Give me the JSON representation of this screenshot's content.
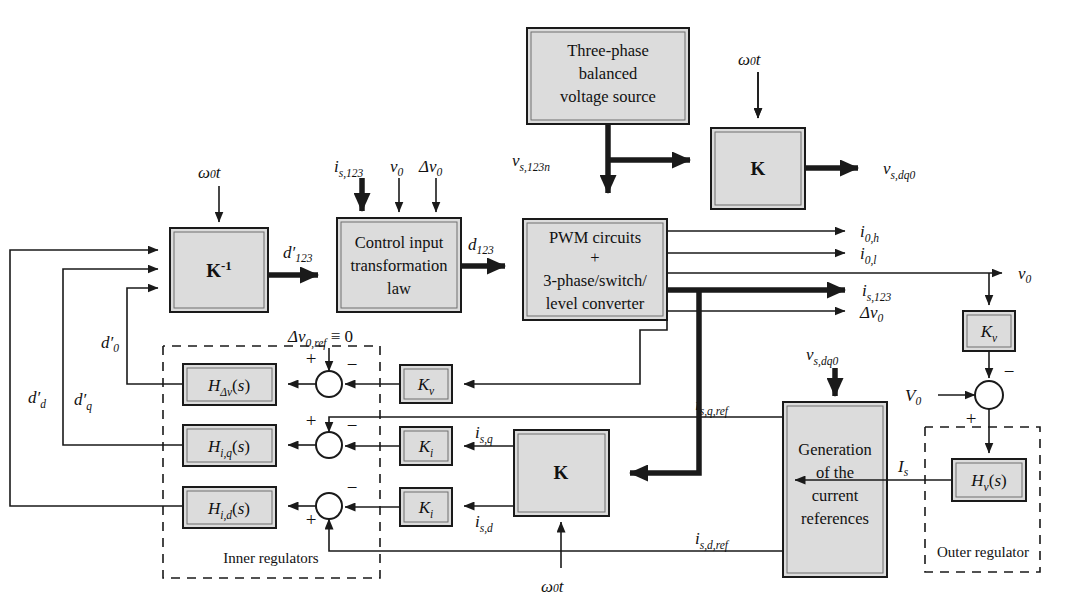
{
  "diagram": {
    "blocks": {
      "source": "Three-phase balanced voltage source",
      "source_l1": "Three-phase",
      "source_l2": "balanced",
      "source_l3": "voltage source",
      "k_top": "K",
      "k_inv": "K−1",
      "control_l1": "Control input",
      "control_l2": "transformation",
      "control_l3": "law",
      "pwm_l1": "PWM circuits",
      "pwm_l2": "+",
      "pwm_l3": "3-phase/switch/",
      "pwm_l4": "level converter",
      "k_mid": "K",
      "gen_l1": "Generation",
      "gen_l2": "of the",
      "gen_l3": "current",
      "gen_l4": "references",
      "h_dv": "H",
      "h_iq": "H",
      "h_id": "H",
      "h_v": "H",
      "kv_left": "K",
      "kv_right": "K",
      "ki_q": "K",
      "ki_d": "K"
    },
    "transfer_labels": {
      "h_dv_sub": "Δv",
      "h_dv_arg": "(s)",
      "h_iq_sub": "i,q",
      "h_iq_arg": "(s)",
      "h_id_sub": "i,d",
      "h_id_arg": "(s)",
      "h_v_sub": "v",
      "h_v_arg": "(s)",
      "kv_sub": "v",
      "ki_sub": "i"
    },
    "signals": {
      "omega_t": "ω0t",
      "omega_base": "ω",
      "omega_sub": "0",
      "omega_var": "t",
      "vs123n": "vs,123n",
      "vsdq0": "vs,dq0",
      "is123": "is,123",
      "v0": "v0",
      "dv0": "Δv0",
      "dp123": "d′123",
      "d123": "d123",
      "i0h": "i0,h",
      "i0l": "i0,l",
      "dv0ref": "Δv0,ref ≡ 0",
      "dpd": "d′d",
      "dpq": "d′q",
      "dp0": "d′0",
      "isq": "is,q",
      "isd": "is,d",
      "isqref": "is,q,ref",
      "isdref": "is,d,ref",
      "Is": "Is",
      "V0": "V0",
      "plus": "+",
      "minus": "−"
    },
    "groups": {
      "inner": "Inner regulators",
      "outer": "Outer regulator"
    },
    "colors": {
      "block_fill": "#dcdcdc",
      "stroke": "#1a1a1a",
      "background": "#ffffff"
    }
  }
}
